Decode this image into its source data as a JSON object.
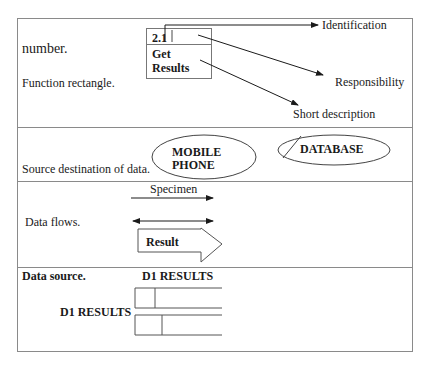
{
  "diagram": {
    "rows": [
      {
        "id": "function",
        "labels": [
          "number.",
          "Function rectangle."
        ],
        "symbol": {
          "type": "process-rectangle",
          "id_text": "2.1",
          "name_lines": [
            "Get",
            "Results"
          ]
        },
        "annotations": [
          "Identification",
          "Responsibility",
          "Short description"
        ]
      },
      {
        "id": "external-entity",
        "label": "Source destination of data.",
        "symbols": [
          {
            "type": "ellipse",
            "lines": [
              "MOBILE",
              "PHONE"
            ]
          },
          {
            "type": "ellipse-duplicate",
            "lines": [
              "DATABASE"
            ]
          }
        ]
      },
      {
        "id": "data-flow",
        "label": "Data flows.",
        "symbols": [
          {
            "type": "arrow",
            "label": "Specimen"
          },
          {
            "type": "double-arrow",
            "label": ""
          },
          {
            "type": "block-arrow",
            "label": "Result"
          }
        ]
      },
      {
        "id": "data-store",
        "label": "Data source.",
        "top_caption": "D1 RESULTS",
        "side_caption": "D1 RESULTS",
        "symbols": [
          {
            "type": "open-rectangle"
          },
          {
            "type": "open-rectangle-duplicate"
          }
        ]
      }
    ]
  },
  "colors": {
    "line": "#1a1a1a",
    "border": "#8a8a8a",
    "background": "#ffffff"
  }
}
